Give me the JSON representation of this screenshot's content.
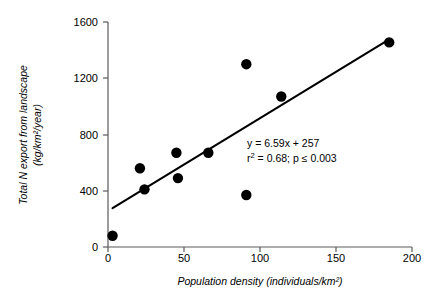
{
  "chart_data": {
    "type": "scatter",
    "title": "",
    "xlabel": "Population density (individuals/km²)",
    "ylabel": "Total N export from landscape (kg/km²/year)",
    "ylabel_line1": "Total N export from landscape",
    "ylabel_line2": "(kg/km²/year)",
    "xlim": [
      0,
      200
    ],
    "ylim": [
      0,
      1600
    ],
    "xticks": [
      0,
      50,
      100,
      150,
      200
    ],
    "yticks": [
      0,
      400,
      800,
      1200,
      1600
    ],
    "xtick_labels": [
      "0",
      "50",
      "100",
      "150",
      "200"
    ],
    "ytick_labels": [
      "0",
      "400",
      "800",
      "1200",
      "1600"
    ],
    "grid": false,
    "legend": "none",
    "marker_color": "#000000",
    "axis_color": "#5a5a5a",
    "line_color": "#000000",
    "points": [
      {
        "x": 3,
        "y": 80
      },
      {
        "x": 21,
        "y": 560
      },
      {
        "x": 24,
        "y": 410
      },
      {
        "x": 45,
        "y": 670
      },
      {
        "x": 46,
        "y": 490
      },
      {
        "x": 66,
        "y": 670
      },
      {
        "x": 91,
        "y": 1300
      },
      {
        "x": 91,
        "y": 370
      },
      {
        "x": 114,
        "y": 1070
      },
      {
        "x": 185,
        "y": 1455
      }
    ],
    "fit_line": {
      "slope": 6.59,
      "intercept": 257,
      "x_start": 3,
      "x_end": 185
    },
    "annotations": {
      "equation": "y = 6.59x + 257",
      "stats_prefix": "r",
      "stats_sup": "2",
      "stats_rest": " = 0.68; p ≤ 0.003"
    }
  }
}
